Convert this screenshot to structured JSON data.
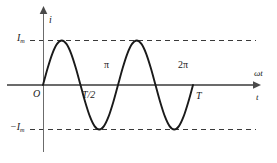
{
  "figure": {
    "background_color": "#ffffff",
    "curve_color": "#1a1a1a",
    "axis_color": "#555555",
    "dash_color": "#3a3a3a"
  },
  "axes": {
    "vertical_axis_label": "i",
    "horizontal_axis_label_upper": "ωt",
    "horizontal_axis_label_lower": "t",
    "origin_label": "O"
  },
  "amplitude_labels": {
    "positive": "I",
    "positive_subscript": "m",
    "negative": "−I",
    "negative_subscript": "m"
  },
  "tick_labels": {
    "phase_half": "π",
    "phase_full": "2π",
    "time_half": "T/2",
    "time_full": "T"
  },
  "chart_data": {
    "type": "line",
    "xlabel": "ωt",
    "ylabel": "i",
    "grid": false,
    "legend": "none",
    "function": "i = I_m sin(ωt)",
    "cycles": 2,
    "xlim": [
      0,
      4.4
    ],
    "ylim": [
      -1.35,
      1.35
    ],
    "x_tick_values": [
      3.14159,
      6.28319
    ],
    "x_tick_labels_upper": [
      "π",
      "2π"
    ],
    "x_tick_labels_lower": [
      "T/2",
      "T"
    ],
    "y_tick_values": [
      1,
      -1
    ],
    "y_tick_labels": [
      "I_m",
      "-I_m"
    ],
    "reference_lines": [
      {
        "orientation": "horizontal",
        "value": 1,
        "style": "dashed",
        "label": "I_m"
      },
      {
        "orientation": "horizontal",
        "value": -1,
        "style": "dashed",
        "label": "-I_m"
      }
    ],
    "annotations": [
      {
        "text": "O",
        "x": 0,
        "y": 0,
        "position": "below-left"
      },
      {
        "text": "π",
        "x": 3.14159,
        "y": 0,
        "position": "above"
      },
      {
        "text": "T/2",
        "x": 3.14159,
        "y": 0,
        "position": "below"
      },
      {
        "text": "2π",
        "x": 6.28319,
        "y": 0,
        "position": "above"
      },
      {
        "text": "T",
        "x": 6.28319,
        "y": 0,
        "position": "below"
      }
    ],
    "series": [
      {
        "name": "i = I_m sin(ωt)",
        "x": [
          0,
          0.3927,
          0.7854,
          1.1781,
          1.5708,
          1.9635,
          2.3562,
          2.7489,
          3.14159,
          3.5343,
          3.927,
          4.3197,
          4.7124,
          5.1051,
          5.4978,
          5.8905,
          6.28319,
          6.6759,
          7.0686,
          7.4613,
          7.854,
          8.2467,
          8.6394,
          9.0321,
          9.42478,
          9.8175,
          10.2102,
          10.6029,
          10.9956,
          11.3883,
          11.781,
          12.1737,
          12.56637
        ],
        "y": [
          0,
          0.3827,
          0.7071,
          0.9239,
          1,
          0.9239,
          0.7071,
          0.3827,
          0,
          -0.3827,
          -0.7071,
          -0.9239,
          -1,
          -0.9239,
          -0.7071,
          -0.3827,
          0,
          0.3827,
          0.7071,
          0.9239,
          1,
          0.9239,
          0.7071,
          0.3827,
          0,
          -0.3827,
          -0.7071,
          -0.9239,
          -1,
          -0.9239,
          -0.7071,
          -0.3827,
          0
        ]
      }
    ]
  }
}
